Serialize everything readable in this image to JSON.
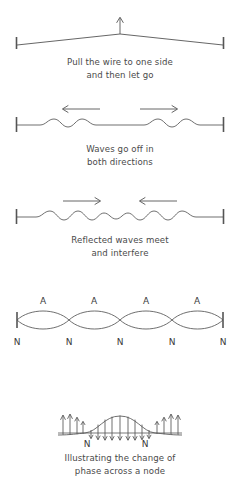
{
  "diagram": {
    "stroke_color": "#555555",
    "text_color": "#4a4a4a",
    "panels": [
      {
        "id": "panel-1",
        "name": "pull-the-wire",
        "caption_line_1": "Pull the wire to one side",
        "caption_line_2": "and then let go",
        "arrows": [
          {
            "name": "displacement-arrow-up",
            "direction": "up"
          }
        ],
        "endpoints": [
          "left-fixed-end",
          "right-fixed-end"
        ]
      },
      {
        "id": "panel-2",
        "name": "waves-go-off",
        "caption_line_1": "Waves go off in",
        "caption_line_2": "both directions",
        "arrows": [
          {
            "name": "wave-direction-arrow-left",
            "direction": "left"
          },
          {
            "name": "wave-direction-arrow-right",
            "direction": "right"
          }
        ],
        "endpoints": [
          "left-fixed-end",
          "right-fixed-end"
        ]
      },
      {
        "id": "panel-3",
        "name": "reflected-waves-meet",
        "caption_line_1": "Reflected waves meet",
        "caption_line_2": "and interfere",
        "arrows": [
          {
            "name": "wave-direction-arrow-right",
            "direction": "right"
          },
          {
            "name": "wave-direction-arrow-left",
            "direction": "left"
          }
        ],
        "endpoints": [
          "left-fixed-end",
          "right-fixed-end"
        ]
      },
      {
        "id": "panel-4",
        "name": "standing-wave-nodes-antinodes",
        "caption_line_1": "",
        "caption_line_2": "",
        "node_label": "N",
        "antinode_label": "A",
        "node_count": 5,
        "antinode_count": 4,
        "node_positions": [
          17,
          69,
          120,
          172,
          223
        ],
        "antinode_positions": [
          43,
          94,
          146,
          197
        ],
        "endpoints": [
          "left-fixed-end",
          "right-fixed-end"
        ]
      },
      {
        "id": "panel-5",
        "name": "phase-change-across-node",
        "caption_line_1": "Illustrating the change of",
        "caption_line_2": "phase across a node",
        "node_label": "N",
        "node_count": 2,
        "node_positions": [
          85,
          142
        ],
        "velocity_arrows_up": 7,
        "velocity_arrows_down": 8
      }
    ]
  }
}
